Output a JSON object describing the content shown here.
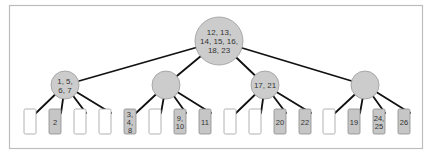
{
  "diagram": {
    "type": "b-tree",
    "colors": {
      "node_fill": "#cccccc",
      "leaf_filled": "#c6c6c6",
      "leaf_empty": "#ffffff",
      "edge": "#111111",
      "frame": "#bdbdbd"
    },
    "root": {
      "keys": "12, 13, 14, 15, 16, 18, 23",
      "lines": [
        "12, 13,",
        "14, 15, 16,",
        "18, 23"
      ]
    },
    "internal_nodes": [
      {
        "keys": "1, 5, 6, 7",
        "lines": [
          "1, 5,",
          "6, 7"
        ]
      },
      {
        "keys": "",
        "lines": []
      },
      {
        "keys": "17, 21",
        "lines": [
          "17, 21"
        ]
      },
      {
        "keys": "",
        "lines": []
      }
    ],
    "leaves": [
      {
        "parent": 0,
        "keys": "",
        "lines": []
      },
      {
        "parent": 0,
        "keys": "2",
        "lines": [
          "2"
        ]
      },
      {
        "parent": 0,
        "keys": "",
        "lines": []
      },
      {
        "parent": 0,
        "keys": "",
        "lines": []
      },
      {
        "parent": 1,
        "keys": "3, 4, 8",
        "lines": [
          "3,",
          "4,",
          "8"
        ]
      },
      {
        "parent": 1,
        "keys": "",
        "lines": []
      },
      {
        "parent": 1,
        "keys": "9, 10",
        "lines": [
          "9,",
          "10"
        ]
      },
      {
        "parent": 1,
        "keys": "11",
        "lines": [
          "11"
        ]
      },
      {
        "parent": 2,
        "keys": "",
        "lines": []
      },
      {
        "parent": 2,
        "keys": "",
        "lines": []
      },
      {
        "parent": 2,
        "keys": "20",
        "lines": [
          "20"
        ]
      },
      {
        "parent": 2,
        "keys": "22",
        "lines": [
          "22"
        ]
      },
      {
        "parent": 3,
        "keys": "",
        "lines": []
      },
      {
        "parent": 3,
        "keys": "19",
        "lines": [
          "19"
        ]
      },
      {
        "parent": 3,
        "keys": "24, 25",
        "lines": [
          "24,",
          "25"
        ]
      },
      {
        "parent": 3,
        "keys": "26",
        "lines": [
          "26"
        ]
      }
    ]
  }
}
